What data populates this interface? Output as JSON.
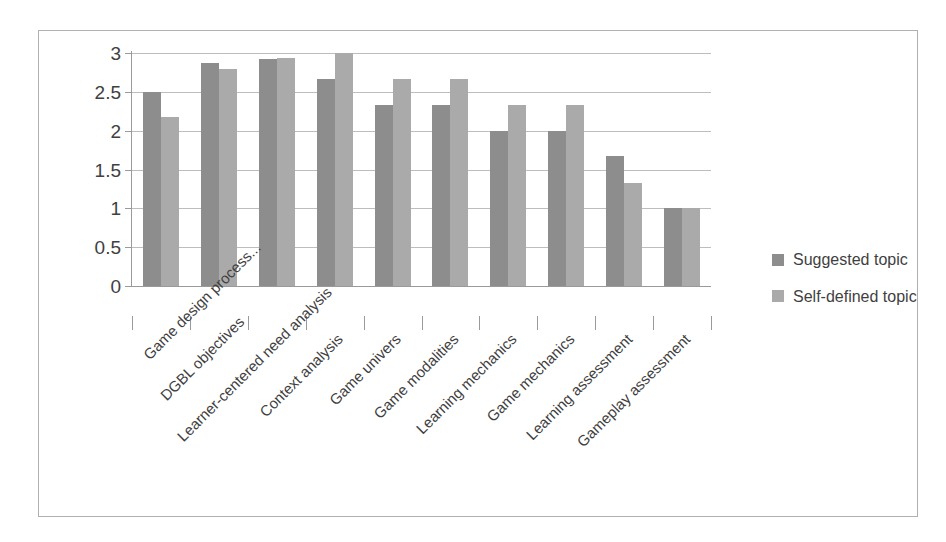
{
  "chart_data": {
    "type": "bar",
    "title": "",
    "xlabel": "",
    "ylabel": "",
    "ylim": [
      0,
      3
    ],
    "ytick_labels": [
      "3",
      "2.5",
      "2",
      "1.5",
      "1",
      "0.5",
      "0"
    ],
    "ytick_values": [
      3,
      2.5,
      2,
      1.5,
      1,
      0.5,
      0
    ],
    "grid": true,
    "legend_position": "right",
    "categories": [
      "Game design process...",
      "DGBL  objectives",
      "Learner-centered need analysis",
      "Context analysis",
      "Game univers",
      "Game modalities",
      "Learning mechanics",
      "Game mechanics",
      "Learning assessment",
      "Gameplay assessment"
    ],
    "series": [
      {
        "name": "Suggested topic",
        "color": "#8d8d8d",
        "values": [
          2.5,
          2.87,
          2.92,
          2.67,
          2.33,
          2.33,
          2.0,
          2.0,
          1.67,
          1.0
        ]
      },
      {
        "name": "Self-defined topic",
        "color": "#aaaaaa",
        "values": [
          2.17,
          2.8,
          2.93,
          3.0,
          2.67,
          2.67,
          2.33,
          2.33,
          1.33,
          1.0
        ]
      }
    ]
  },
  "legend": {
    "items": [
      {
        "label": "Suggested topic",
        "swatch": "suggested"
      },
      {
        "label": "Self-defined topic",
        "swatch": "selfdefined"
      }
    ]
  },
  "colors": {
    "suggested": "#8d8d8d",
    "self_defined": "#aaaaaa",
    "grid": "#bdbdbd",
    "axis": "#9a9a9a",
    "border": "#b0b0b0",
    "background": "#ffffff"
  }
}
